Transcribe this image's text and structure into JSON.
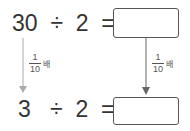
{
  "row1": {
    "a": "30",
    "op": "÷",
    "b": "2",
    "eq": "=",
    "answer": ""
  },
  "row2": {
    "a": "3",
    "op": "÷",
    "b": "2",
    "eq": "=",
    "answer": ""
  },
  "left_arrow": {
    "numerator": "1",
    "denominator": "10",
    "unit": "배"
  },
  "right_arrow": {
    "numerator": "1",
    "denominator": "10",
    "unit": "배"
  },
  "colors": {
    "left_arrow": "#aaaaaa",
    "right_arrow": "#666666",
    "box_border": "#555555"
  }
}
